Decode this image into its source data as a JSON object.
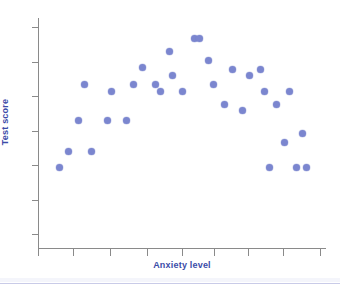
{
  "figure": {
    "background_color": "#ffffff",
    "axis_color": "#8a8a8a",
    "label_color": "#3b4ba8",
    "point_color": "#7b86cf",
    "rule_color": "#c9cbe8"
  },
  "chart_data": {
    "type": "scatter",
    "title": "",
    "xlabel": "Anxiety level",
    "ylabel": "Test score",
    "xlim": [
      0,
      10
    ],
    "ylim": [
      0,
      10
    ],
    "grid": false,
    "legend": null,
    "xticks": [
      0,
      1.2,
      2.5,
      3.8,
      5.0,
      6.1,
      7.3,
      8.5,
      9.8
    ],
    "xtick_labels": [
      "",
      "",
      "",
      "",
      "",
      "",
      "",
      "",
      ""
    ],
    "yticks": [
      0.6,
      2.1,
      3.6,
      5.1,
      6.6,
      8.1,
      9.6
    ],
    "ytick_labels": [
      "",
      "",
      "",
      "",
      "",
      "",
      ""
    ],
    "series": [
      {
        "name": "observations",
        "n_points": 34,
        "marker": "circle",
        "color": "#7b86cf",
        "points": [
          {
            "x": 0.76,
            "y": 3.51
          },
          {
            "x": 1.06,
            "y": 4.19
          },
          {
            "x": 1.39,
            "y": 5.55
          },
          {
            "x": 1.6,
            "y": 7.11
          },
          {
            "x": 1.86,
            "y": 4.19
          },
          {
            "x": 2.43,
            "y": 5.55
          },
          {
            "x": 2.54,
            "y": 6.82
          },
          {
            "x": 3.06,
            "y": 5.55
          },
          {
            "x": 3.33,
            "y": 7.11
          },
          {
            "x": 3.62,
            "y": 7.84
          },
          {
            "x": 4.09,
            "y": 7.11
          },
          {
            "x": 4.26,
            "y": 6.82
          },
          {
            "x": 4.55,
            "y": 8.53
          },
          {
            "x": 4.68,
            "y": 7.5
          },
          {
            "x": 5.0,
            "y": 6.82
          },
          {
            "x": 5.44,
            "y": 9.12
          },
          {
            "x": 5.62,
            "y": 9.12
          },
          {
            "x": 5.93,
            "y": 8.14
          },
          {
            "x": 6.11,
            "y": 7.11
          },
          {
            "x": 6.46,
            "y": 6.24
          },
          {
            "x": 6.76,
            "y": 7.74
          },
          {
            "x": 7.09,
            "y": 6.0
          },
          {
            "x": 7.33,
            "y": 7.5
          },
          {
            "x": 7.72,
            "y": 7.74
          },
          {
            "x": 7.86,
            "y": 6.82
          },
          {
            "x": 8.05,
            "y": 3.51
          },
          {
            "x": 8.28,
            "y": 6.24
          },
          {
            "x": 8.56,
            "y": 4.58
          },
          {
            "x": 8.73,
            "y": 6.82
          },
          {
            "x": 8.99,
            "y": 3.51
          },
          {
            "x": 9.17,
            "y": 5.0
          },
          {
            "x": 9.33,
            "y": 3.51
          }
        ]
      }
    ]
  },
  "axes": {
    "y_title": "Test score",
    "x_title": "Anxiety level"
  }
}
